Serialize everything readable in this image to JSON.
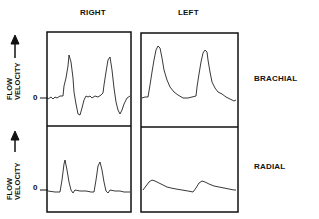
{
  "columns": {
    "right": "RIGHT",
    "left": "LEFT"
  },
  "rows": {
    "brachial": "BRACHIAL",
    "radial": "RADIAL"
  },
  "y_axis": {
    "line1": "FLOW",
    "line2": "VELOCITY",
    "arrow": "→",
    "zero": "0"
  },
  "panels": [
    {
      "artery": "Brachial",
      "side": "Right",
      "description": "Sharp triphasic waveform with reverse flow below zero"
    },
    {
      "artery": "Brachial",
      "side": "Left",
      "description": "Broad peaks, no reverse flow"
    },
    {
      "artery": "Radial",
      "side": "Right",
      "description": "Sharp peaks"
    },
    {
      "artery": "Radial",
      "side": "Left",
      "description": "Dampened low-amplitude waveform"
    }
  ]
}
